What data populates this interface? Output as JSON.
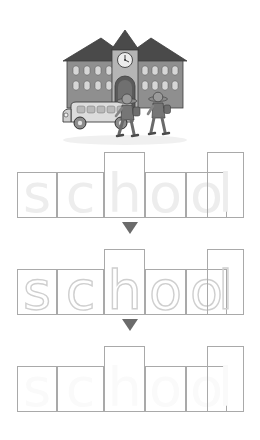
{
  "worksheet": {
    "word": "school",
    "letters": [
      "s",
      "c",
      "h",
      "o",
      "o",
      "l"
    ],
    "illustration_alt": "school-building-bus-children"
  },
  "illustration": {
    "name": "school-scene",
    "elements": {
      "building": "school-building",
      "clock": "clock-tower-clock",
      "clock_time": "10:10",
      "bus": "school-bus",
      "child_1": "child-walking",
      "child_2": "child-walking",
      "door": "arched-door"
    },
    "colors": {
      "roof": "#4a4a4a",
      "wall": "#8f8f8f",
      "tower": "#b5b5b5",
      "window": "#d6d6d6",
      "bus_body": "#d9d9d9",
      "bus_trim": "#9a9a9a",
      "child": "#707070",
      "outline": "#3d3d3d"
    }
  },
  "rows": [
    {
      "name": "row-faded-letters",
      "style": "faded",
      "letters": [
        "s",
        "c",
        "h",
        "o",
        "o",
        "l"
      ],
      "tall": [
        false,
        false,
        true,
        false,
        false,
        true
      ]
    },
    {
      "name": "row-dotted-trace",
      "style": "dotted",
      "letters": [
        "s",
        "c",
        "h",
        "o",
        "o",
        "l"
      ],
      "tall": [
        false,
        false,
        true,
        false,
        false,
        true
      ]
    },
    {
      "name": "row-blank-practice",
      "style": "blank",
      "letters": [
        "s",
        "c",
        "h",
        "o",
        "o",
        "l"
      ],
      "tall": [
        false,
        false,
        true,
        false,
        false,
        true
      ]
    }
  ],
  "arrows": {
    "glyph": "▼",
    "color": "#6b6b6b",
    "count": 2
  },
  "colors": {
    "box_border": "#a9a9a9",
    "ghost_letter": "#ededed",
    "dotted_letter": "#cfcfcf",
    "faint_letter": "#fafafa",
    "background": "#ffffff"
  }
}
